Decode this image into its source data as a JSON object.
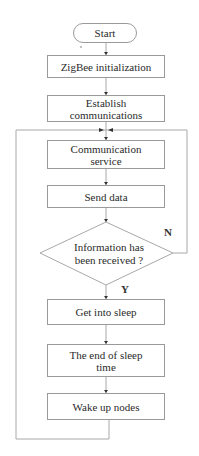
{
  "flowchart": {
    "start": "Start",
    "steps": [
      "ZigBee initialization",
      "Establish communications",
      "Communication service",
      "Send data"
    ],
    "decision": "Information has been received ?",
    "decision_no": "N",
    "decision_yes": "Y",
    "after_steps": [
      "Get into sleep",
      "The end of sleep time",
      "Wake up nodes"
    ]
  },
  "colors": {
    "line": "#9a9a9a",
    "arrow": "#333333",
    "text": "#2a2a2a"
  }
}
